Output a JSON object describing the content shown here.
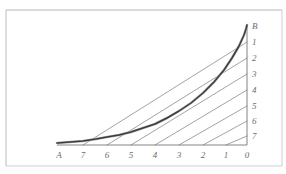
{
  "figure": {
    "paper_color": "#ffffff",
    "frame_color": "#cfcfd2",
    "ink_color": "#76767a",
    "curve_color": "#3c3c40",
    "label_color": "#6d6d70",
    "frame": {
      "left": 6,
      "top": 10,
      "right": 282,
      "bottom": 166
    }
  },
  "chart_data": {
    "type": "line",
    "title": "",
    "xlabel": "",
    "ylabel": "",
    "grid": false,
    "legend": null,
    "axes": {
      "origin_px": {
        "x": 247,
        "y": 145
      },
      "x_axis": {
        "from_px": 57,
        "to_px": 247,
        "y_px": 145,
        "direction": "values decrease left to right"
      },
      "y_axis": {
        "x_px": 247,
        "from_px": 145,
        "to_px": 26,
        "direction": "values decrease bottom to top"
      }
    },
    "x_ticks": [
      {
        "label": "A",
        "x_px": 59
      },
      {
        "label": "7",
        "x_px": 83
      },
      {
        "label": "6",
        "x_px": 107
      },
      {
        "label": "5",
        "x_px": 131
      },
      {
        "label": "4",
        "x_px": 155
      },
      {
        "label": "3",
        "x_px": 179
      },
      {
        "label": "2",
        "x_px": 203
      },
      {
        "label": "1",
        "x_px": 226
      },
      {
        "label": "0",
        "x_px": 247
      }
    ],
    "y_ticks": [
      {
        "label": "B",
        "y_px": 26
      },
      {
        "label": "1",
        "y_px": 42
      },
      {
        "label": "2",
        "y_px": 58
      },
      {
        "label": "3",
        "y_px": 74
      },
      {
        "label": "4",
        "y_px": 90
      },
      {
        "label": "5",
        "y_px": 106
      },
      {
        "label": "6",
        "y_px": 121
      },
      {
        "label": "7",
        "y_px": 136
      }
    ],
    "chords": [
      {
        "index": 1,
        "from_x_px": 226,
        "to_y_px": 136
      },
      {
        "index": 2,
        "from_x_px": 203,
        "to_y_px": 121
      },
      {
        "index": 3,
        "from_x_px": 179,
        "to_y_px": 106
      },
      {
        "index": 4,
        "from_x_px": 155,
        "to_y_px": 90
      },
      {
        "index": 5,
        "from_x_px": 131,
        "to_y_px": 74
      },
      {
        "index": 6,
        "from_x_px": 107,
        "to_y_px": 58
      },
      {
        "index": 7,
        "from_x_px": 83,
        "to_y_px": 42
      }
    ],
    "envelope_curve": {
      "name": "envelope",
      "points_px": [
        {
          "x": 57,
          "y": 143
        },
        {
          "x": 70,
          "y": 142
        },
        {
          "x": 83,
          "y": 141
        },
        {
          "x": 96,
          "y": 139
        },
        {
          "x": 107,
          "y": 137
        },
        {
          "x": 119,
          "y": 135
        },
        {
          "x": 131,
          "y": 132
        },
        {
          "x": 143,
          "y": 128
        },
        {
          "x": 155,
          "y": 124
        },
        {
          "x": 167,
          "y": 118
        },
        {
          "x": 179,
          "y": 111
        },
        {
          "x": 191,
          "y": 103
        },
        {
          "x": 203,
          "y": 93
        },
        {
          "x": 214,
          "y": 82
        },
        {
          "x": 224,
          "y": 70
        },
        {
          "x": 232,
          "y": 58
        },
        {
          "x": 239,
          "y": 46
        },
        {
          "x": 244,
          "y": 35
        },
        {
          "x": 246,
          "y": 29
        },
        {
          "x": 247,
          "y": 25
        }
      ]
    }
  },
  "labels": {
    "x_axis_origin": "A",
    "y_axis_origin": "B",
    "corner": "0"
  }
}
